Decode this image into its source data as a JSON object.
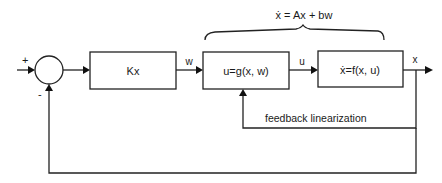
{
  "diagram": {
    "type": "block-diagram",
    "summing_junction": {
      "plus_sign": "+",
      "minus_sign": "-"
    },
    "blocks": [
      {
        "id": "controller",
        "label": "Kx"
      },
      {
        "id": "linearizing-law",
        "label": "u=g(x, w)"
      },
      {
        "id": "plant",
        "label": "ẋ=f(x, u)"
      }
    ],
    "signals": {
      "w": "w",
      "u": "u",
      "x": "x"
    },
    "brace_label": "ẋ = Ax + bw",
    "inner_loop_label": "feedback linearization",
    "colors": {
      "line": "#222222",
      "background": "#ffffff"
    }
  }
}
